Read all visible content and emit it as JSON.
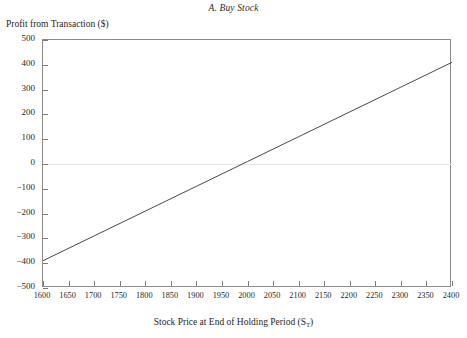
{
  "figure": {
    "title": "A. Buy Stock",
    "ylabel": "Profit from Transaction ($)",
    "xlabel_main": "Stock Price at End of Holding Period (S",
    "xlabel_sub": "T",
    "xlabel_tail": ")",
    "background_color": "#ffffff",
    "frame_color": "#8c8c8c",
    "line_color": "#333333",
    "zero_line_color": "#e6e6e6"
  },
  "chart_data": {
    "type": "line",
    "title": "A. Buy Stock",
    "xlabel": "Stock Price at End of Holding Period (S_T)",
    "ylabel": "Profit from Transaction ($)",
    "xlim": [
      1600,
      2400
    ],
    "ylim": [
      -500,
      500
    ],
    "grid": false,
    "legend": "none",
    "xticks": [
      1600,
      1650,
      1700,
      1750,
      1800,
      1850,
      1900,
      1950,
      2000,
      2050,
      2100,
      2150,
      2200,
      2250,
      2300,
      2350,
      2400
    ],
    "xtick_labels": [
      "1600",
      "1650",
      "1700",
      "1750",
      "1800",
      "1850",
      "1900",
      "1950",
      "2000",
      "2050",
      "2100",
      "2150",
      "2200",
      "2250",
      "2300",
      "2350",
      "2400"
    ],
    "yticks": [
      500,
      400,
      300,
      200,
      100,
      0,
      -100,
      -200,
      -300,
      -400,
      -500
    ],
    "ytick_labels": [
      "500",
      "400",
      "300",
      "200",
      "100",
      "0",
      "−100",
      "−200",
      "−300",
      "−400",
      "−500"
    ],
    "zero_reference_line": 0,
    "series": [
      {
        "name": "Buy Stock Profit",
        "x": [
          1600,
          1700,
          1800,
          1900,
          1990,
          2000,
          2100,
          2200,
          2300,
          2400
        ],
        "values": [
          -390,
          -290,
          -190,
          -90,
          0,
          10,
          110,
          210,
          310,
          410
        ]
      }
    ]
  }
}
